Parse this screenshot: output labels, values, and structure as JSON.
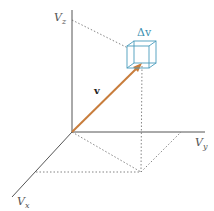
{
  "diagram": {
    "colors": {
      "axis": "#555555",
      "guide": "#777777",
      "vector": "#c87d3c",
      "cube": "#4a9cbc",
      "background": "#ffffff"
    },
    "axes": {
      "z": {
        "label": "V",
        "sub": "z"
      },
      "y": {
        "label": "V",
        "sub": "y"
      },
      "x": {
        "label": "V",
        "sub": "x"
      }
    },
    "vector": {
      "label": "v"
    },
    "volume_element": {
      "label": "Δv"
    }
  }
}
